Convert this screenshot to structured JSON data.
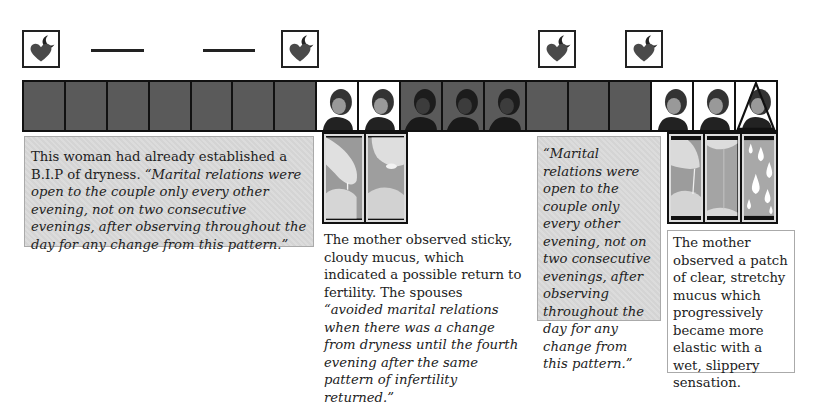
{
  "diagram": {
    "title": "",
    "colors": {
      "dry_cell": "#5a5a5a",
      "heart": "#4a4a4a",
      "note_shaded_bg": "#d4d4d4",
      "border": "#111111"
    },
    "top_row": [
      {
        "position": 1,
        "marker": "heart-moon-icon"
      },
      {
        "position": 3,
        "marker": "dash"
      },
      {
        "position": 6,
        "marker": "dash"
      },
      {
        "position": 7,
        "marker": "heart-moon-icon"
      },
      {
        "position": 13,
        "marker": "heart-moon-icon"
      },
      {
        "position": 15,
        "marker": "heart-moon-icon"
      }
    ],
    "cells": [
      {
        "day": 1,
        "type": "dry"
      },
      {
        "day": 2,
        "type": "dry"
      },
      {
        "day": 3,
        "type": "dry"
      },
      {
        "day": 4,
        "type": "dry"
      },
      {
        "day": 5,
        "type": "dry"
      },
      {
        "day": 6,
        "type": "dry"
      },
      {
        "day": 7,
        "type": "dry"
      },
      {
        "day": 8,
        "type": "baby-light"
      },
      {
        "day": 9,
        "type": "baby-light"
      },
      {
        "day": 10,
        "type": "baby-dark"
      },
      {
        "day": 11,
        "type": "baby-dark"
      },
      {
        "day": 12,
        "type": "baby-dark"
      },
      {
        "day": 13,
        "type": "dry"
      },
      {
        "day": 14,
        "type": "dry"
      },
      {
        "day": 15,
        "type": "dry"
      },
      {
        "day": 16,
        "type": "baby-light"
      },
      {
        "day": 17,
        "type": "baby-light"
      },
      {
        "day": 18,
        "type": "baby-light-peak"
      }
    ],
    "notes": {
      "note1": {
        "plain": "This woman had already established a B.I.P of dryness. ",
        "italic": "“Marital relations were open to the couple only every other evening, not on two consecutive evenings, after observing throughout the day for any change from this pattern.”"
      },
      "note2": {
        "plain": "The mother observed sticky, cloudy mucus, which indicated a possible return to fertility. The spouses ",
        "italic": "“avoided marital relations when there was a change from dryness until the fourth evening after the same pattern of infertility returned.”"
      },
      "note3": {
        "italic": "“Marital relations were open to the couple only every other evening, not on two consecutive evenings, after observing throughout the day for any change from this pattern.”"
      },
      "note4": {
        "plain": "The mother observed a patch of clear, stretchy mucus which progressively became more elastic with a wet, slippery sensation."
      }
    },
    "photo_groups": [
      {
        "under_days": [
          8,
          9
        ],
        "images": [
          "sticky-mucus-fingers",
          "sticky-mucus-drop"
        ]
      },
      {
        "under_days": [
          16,
          17,
          18
        ],
        "images": [
          "stretchy-mucus-fingers",
          "stretchy-mucus-strand",
          "wet-droplets"
        ]
      }
    ]
  }
}
